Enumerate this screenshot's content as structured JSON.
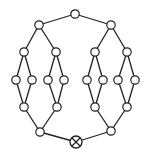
{
  "diagram": {
    "type": "graph",
    "colors": {
      "stroke": "#222222",
      "fill": "#ffffff",
      "background": "#ffffff"
    },
    "nodes": [
      {
        "id": "top",
        "x": 75,
        "y": 14,
        "r": 4.2,
        "kind": "circle"
      },
      {
        "id": "L1",
        "x": 39,
        "y": 25,
        "r": 4.2,
        "kind": "circle"
      },
      {
        "id": "R1",
        "x": 111,
        "y": 25,
        "r": 4.2,
        "kind": "circle"
      },
      {
        "id": "LL",
        "x": 24,
        "y": 52,
        "r": 4.2,
        "kind": "circle"
      },
      {
        "id": "LR",
        "x": 56,
        "y": 52,
        "r": 4.2,
        "kind": "circle"
      },
      {
        "id": "RL",
        "x": 95,
        "y": 52,
        "r": 4.2,
        "kind": "circle"
      },
      {
        "id": "RR",
        "x": 127,
        "y": 52,
        "r": 4.2,
        "kind": "circle"
      },
      {
        "id": "a1",
        "x": 16,
        "y": 80,
        "r": 4.2,
        "kind": "circle"
      },
      {
        "id": "a2",
        "x": 32,
        "y": 80,
        "r": 4.2,
        "kind": "circle"
      },
      {
        "id": "a3",
        "x": 48,
        "y": 80,
        "r": 4.2,
        "kind": "circle"
      },
      {
        "id": "a4",
        "x": 64,
        "y": 80,
        "r": 4.2,
        "kind": "circle"
      },
      {
        "id": "a5",
        "x": 87,
        "y": 80,
        "r": 4.2,
        "kind": "circle"
      },
      {
        "id": "a6",
        "x": 103,
        "y": 80,
        "r": 4.2,
        "kind": "circle"
      },
      {
        "id": "a7",
        "x": 118,
        "y": 80,
        "r": 4.2,
        "kind": "circle"
      },
      {
        "id": "a8",
        "x": 135,
        "y": 80,
        "r": 4.2,
        "kind": "circle"
      },
      {
        "id": "LLb",
        "x": 24,
        "y": 107,
        "r": 4.2,
        "kind": "circle"
      },
      {
        "id": "LRb",
        "x": 57,
        "y": 107,
        "r": 4.2,
        "kind": "circle"
      },
      {
        "id": "RLb",
        "x": 95,
        "y": 107,
        "r": 4.2,
        "kind": "circle"
      },
      {
        "id": "RRb",
        "x": 127,
        "y": 107,
        "r": 4.2,
        "kind": "circle"
      },
      {
        "id": "L2",
        "x": 40,
        "y": 132,
        "r": 4.2,
        "kind": "circle"
      },
      {
        "id": "R2",
        "x": 111,
        "y": 131,
        "r": 4.2,
        "kind": "circle"
      },
      {
        "id": "sink",
        "x": 76,
        "y": 142,
        "r": 6,
        "kind": "crossed-circle"
      }
    ],
    "edges": [
      [
        "top",
        "L1"
      ],
      [
        "top",
        "R1"
      ],
      [
        "L1",
        "LL"
      ],
      [
        "L1",
        "LR"
      ],
      [
        "R1",
        "RL"
      ],
      [
        "R1",
        "RR"
      ],
      [
        "LL",
        "a1"
      ],
      [
        "LL",
        "a2"
      ],
      [
        "LR",
        "a3"
      ],
      [
        "LR",
        "a4"
      ],
      [
        "RL",
        "a5"
      ],
      [
        "RL",
        "a6"
      ],
      [
        "RR",
        "a7"
      ],
      [
        "RR",
        "a8"
      ],
      [
        "a1",
        "LLb"
      ],
      [
        "a2",
        "LLb"
      ],
      [
        "a3",
        "LRb"
      ],
      [
        "a4",
        "LRb"
      ],
      [
        "a5",
        "RLb"
      ],
      [
        "a6",
        "RLb"
      ],
      [
        "a7",
        "RRb"
      ],
      [
        "a8",
        "RRb"
      ],
      [
        "LLb",
        "L2"
      ],
      [
        "LRb",
        "L2"
      ],
      [
        "RLb",
        "R2"
      ],
      [
        "RRb",
        "R2"
      ],
      [
        "L2",
        "sink"
      ],
      [
        "R2",
        "sink"
      ]
    ]
  }
}
